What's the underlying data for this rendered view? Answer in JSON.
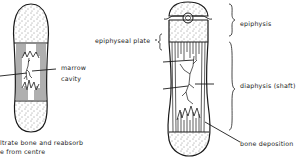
{
  "left_bone": {
    "labels": {
      "marrow_line1": "marrow",
      "marrow_line2": "cavity",
      "caption_line1": "ltrate bone and reabsorb",
      "caption_line2": "e from centre"
    }
  },
  "right_bone": {
    "labels": {
      "epiphyseal_plate": "epiphyseal plate",
      "epiphysis": "epiphysis",
      "diaphysis": "diaphysis (shaft)",
      "bone_deposition": "bone deposition"
    }
  },
  "colors": {
    "ink": "#1a1a1a",
    "background": "#ffffff"
  }
}
